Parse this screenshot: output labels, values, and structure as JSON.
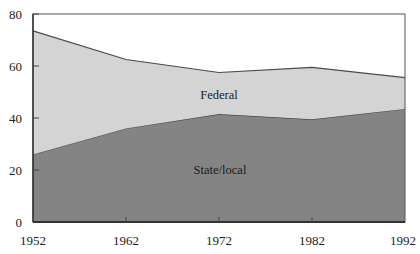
{
  "chart_data": {
    "type": "area",
    "stacked": true,
    "title": "",
    "xlabel": "",
    "ylabel": "",
    "x": [
      1952,
      1962,
      1972,
      1982,
      1992
    ],
    "series": [
      {
        "name": "State/local",
        "values": [
          26,
          36,
          41.5,
          39.5,
          43.5
        ],
        "color": "#848484"
      },
      {
        "name": "Federal",
        "values": [
          47.5,
          26.5,
          16,
          20,
          12
        ],
        "color": "#d4d4d4"
      }
    ],
    "totals": [
      73.5,
      62.5,
      57.5,
      59.5,
      55.5
    ],
    "ylim": [
      0,
      80
    ],
    "yticks": [
      0,
      20,
      40,
      60,
      80
    ],
    "xticks": [
      1952,
      1962,
      1972,
      1982,
      1992
    ],
    "grid": false,
    "legend": "inline labels",
    "annotations": [
      {
        "text": "Federal",
        "x": 1972,
        "y": 49
      },
      {
        "text": "State/local",
        "x": 1972,
        "y": 20
      }
    ]
  },
  "labels": {
    "federal": "Federal",
    "state_local": "State/local"
  },
  "colors": {
    "state_local_fill": "#848484",
    "federal_fill": "#d4d4d4",
    "line": "#4a4a4a",
    "axis": "#555555"
  }
}
